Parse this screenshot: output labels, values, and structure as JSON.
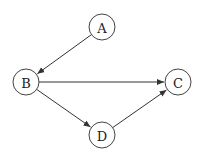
{
  "diagram": {
    "type": "directed-graph",
    "nodes": [
      {
        "id": "A",
        "label": "A"
      },
      {
        "id": "B",
        "label": "B"
      },
      {
        "id": "C",
        "label": "C"
      },
      {
        "id": "D",
        "label": "D"
      }
    ],
    "edges": [
      {
        "from": "A",
        "to": "B"
      },
      {
        "from": "B",
        "to": "C"
      },
      {
        "from": "B",
        "to": "D"
      },
      {
        "from": "D",
        "to": "C"
      }
    ],
    "colors": {
      "node_stroke": "#444444",
      "edge": "#333333",
      "background": "#ffffff"
    }
  }
}
